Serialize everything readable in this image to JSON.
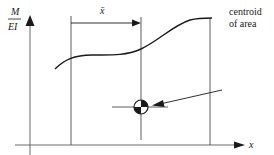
{
  "diagram": {
    "y_axis_label_numerator": "M",
    "y_axis_label_denominator": "EI",
    "x_axis_label": "x",
    "xbar_label": "x̄",
    "annotation_line1": "centroid",
    "annotation_line2": "of area",
    "colors": {
      "line": "#1a1a1a",
      "axis": "#6b6b6b",
      "background": "#ffffff"
    }
  }
}
